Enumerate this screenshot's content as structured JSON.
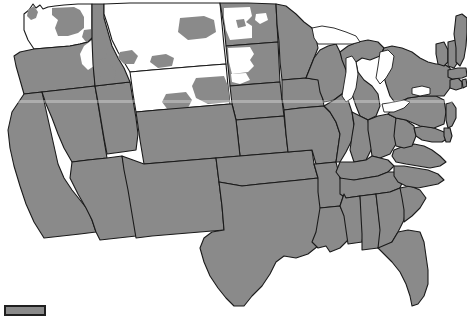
{
  "map": {
    "title": "United States Range Map",
    "projection": "contiguous-us-albers",
    "width": 467,
    "height": 318,
    "background_color": "#ffffff",
    "border_color": "#1a1a1a",
    "colors": {
      "present_gray": "#8a8a8a",
      "absent_white": "#ffffff",
      "outline": "#1a1a1a",
      "legend_border": "#1f1f1f"
    },
    "categories": [
      {
        "key": "gray",
        "color": "#8a8a8a",
        "meaning": "shaded / included area"
      },
      {
        "key": "white",
        "color": "#ffffff",
        "meaning": "unshaded / excluded area"
      }
    ],
    "legend": {
      "swatch_color": "#8a8a8a",
      "swatch_border": "#1f1f1f",
      "label": ""
    },
    "scanline": {
      "visible": true,
      "y": 100,
      "color": "rgba(255,255,255,0.30)"
    },
    "states": [
      {
        "id": "WA",
        "name": "Washington",
        "fill": "white",
        "has_gray_patches": true
      },
      {
        "id": "OR",
        "name": "Oregon",
        "fill": "gray",
        "has_white_patches": true
      },
      {
        "id": "ID",
        "name": "Idaho",
        "fill": "white",
        "has_gray_patches": true
      },
      {
        "id": "MT",
        "name": "Montana",
        "fill": "white",
        "has_gray_patches": true
      },
      {
        "id": "WY",
        "name": "Wyoming",
        "fill": "white",
        "has_gray_patches": true
      },
      {
        "id": "ND",
        "name": "North Dakota",
        "fill": "gray",
        "has_white_patches": true
      },
      {
        "id": "SD",
        "name": "South Dakota",
        "fill": "gray",
        "has_white_patches": true
      },
      {
        "id": "CA",
        "name": "California",
        "fill": "gray"
      },
      {
        "id": "NV",
        "name": "Nevada",
        "fill": "gray"
      },
      {
        "id": "UT",
        "name": "Utah",
        "fill": "gray"
      },
      {
        "id": "AZ",
        "name": "Arizona",
        "fill": "gray"
      },
      {
        "id": "CO",
        "name": "Colorado",
        "fill": "gray"
      },
      {
        "id": "NM",
        "name": "New Mexico",
        "fill": "gray"
      },
      {
        "id": "NE",
        "name": "Nebraska",
        "fill": "gray"
      },
      {
        "id": "KS",
        "name": "Kansas",
        "fill": "gray"
      },
      {
        "id": "OK",
        "name": "Oklahoma",
        "fill": "gray"
      },
      {
        "id": "TX",
        "name": "Texas",
        "fill": "gray"
      },
      {
        "id": "MN",
        "name": "Minnesota",
        "fill": "gray"
      },
      {
        "id": "IA",
        "name": "Iowa",
        "fill": "gray"
      },
      {
        "id": "MO",
        "name": "Missouri",
        "fill": "gray"
      },
      {
        "id": "AR",
        "name": "Arkansas",
        "fill": "gray"
      },
      {
        "id": "LA",
        "name": "Louisiana",
        "fill": "gray"
      },
      {
        "id": "WI",
        "name": "Wisconsin",
        "fill": "gray"
      },
      {
        "id": "IL",
        "name": "Illinois",
        "fill": "gray"
      },
      {
        "id": "MI",
        "name": "Michigan",
        "fill": "gray"
      },
      {
        "id": "IN",
        "name": "Indiana",
        "fill": "gray"
      },
      {
        "id": "OH",
        "name": "Ohio",
        "fill": "gray"
      },
      {
        "id": "KY",
        "name": "Kentucky",
        "fill": "gray"
      },
      {
        "id": "TN",
        "name": "Tennessee",
        "fill": "gray"
      },
      {
        "id": "MS",
        "name": "Mississippi",
        "fill": "gray"
      },
      {
        "id": "AL",
        "name": "Alabama",
        "fill": "gray"
      },
      {
        "id": "GA",
        "name": "Georgia",
        "fill": "gray"
      },
      {
        "id": "FL",
        "name": "Florida",
        "fill": "gray"
      },
      {
        "id": "SC",
        "name": "South Carolina",
        "fill": "gray"
      },
      {
        "id": "NC",
        "name": "North Carolina",
        "fill": "gray"
      },
      {
        "id": "VA",
        "name": "Virginia",
        "fill": "gray"
      },
      {
        "id": "WV",
        "name": "West Virginia",
        "fill": "gray"
      },
      {
        "id": "MD",
        "name": "Maryland",
        "fill": "gray"
      },
      {
        "id": "DE",
        "name": "Delaware",
        "fill": "gray"
      },
      {
        "id": "PA",
        "name": "Pennsylvania",
        "fill": "gray"
      },
      {
        "id": "NJ",
        "name": "New Jersey",
        "fill": "gray"
      },
      {
        "id": "NY",
        "name": "New York",
        "fill": "gray"
      },
      {
        "id": "CT",
        "name": "Connecticut",
        "fill": "gray"
      },
      {
        "id": "RI",
        "name": "Rhode Island",
        "fill": "gray"
      },
      {
        "id": "MA",
        "name": "Massachusetts",
        "fill": "gray"
      },
      {
        "id": "VT",
        "name": "Vermont",
        "fill": "gray"
      },
      {
        "id": "NH",
        "name": "New Hampshire",
        "fill": "gray"
      },
      {
        "id": "ME",
        "name": "Maine",
        "fill": "gray"
      }
    ],
    "lakes": [
      {
        "id": "LM",
        "name": "Lake Michigan"
      },
      {
        "id": "LS",
        "name": "Lake Superior"
      },
      {
        "id": "LH",
        "name": "Lake Huron"
      },
      {
        "id": "LE",
        "name": "Lake Erie"
      },
      {
        "id": "LO",
        "name": "Lake Ontario"
      }
    ]
  }
}
